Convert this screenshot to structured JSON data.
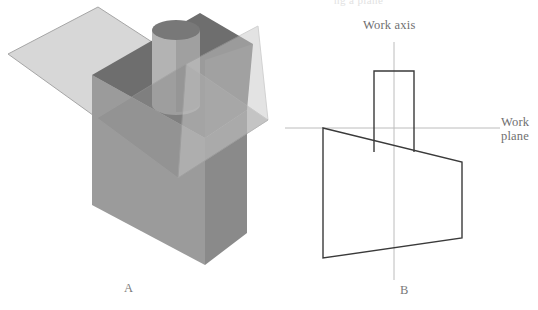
{
  "figure": {
    "background_color": "#ffffff",
    "partial_top_caption": "ng a plane",
    "panels": [
      {
        "id": "panel-a",
        "label": "A",
        "description": "Shaded 3D isometric view of a rectangular block with a cylindrical boss on top, intersected by a translucent work plane",
        "label_x": 124,
        "label_y": 282
      },
      {
        "id": "panel-b",
        "label": "B",
        "description": "2D orthographic profile outline of the same solid relative to the work axis and work plane",
        "label_x": 400,
        "label_y": 284
      }
    ],
    "annotations": [
      {
        "id": "work-axis",
        "text": "Work axis",
        "lines": [
          "Work axis"
        ],
        "x": 363,
        "y": 19
      },
      {
        "id": "work-plane",
        "text": "Work plane",
        "lines": [
          "Work",
          "plane"
        ],
        "x": 501,
        "y": 116
      }
    ],
    "colors": {
      "outline": "#3a3a3a",
      "construction_line": "#b9b9b9",
      "text": "#6f6f6f",
      "plane_translucent_light": "#d6d6d6",
      "plane_translucent_over_solid": "#8e8e8e",
      "plane_edge": "#9d9d9d",
      "block_top_face": "#6e6e6e",
      "block_front_left_face": "#9b9b9b",
      "block_front_right_face": "#8a8a8a",
      "block_side_dark_face": "#777777",
      "cylinder_top_ellipse": "#787878",
      "cylinder_body_light": "#b6b6b6",
      "cylinder_body_shadow": "#8f8f8f"
    },
    "geometry": {
      "panel_b": {
        "work_plane_line": {
          "x1": 285,
          "y1": 128,
          "x2": 500,
          "y2": 128
        },
        "work_axis_line": {
          "x1": 394,
          "y1": 42,
          "x2": 394,
          "y2": 280
        },
        "cylinder_rect": {
          "left": 374,
          "top": 71,
          "right": 414,
          "bottom": 152
        },
        "body_outline": [
          [
            323,
            128
          ],
          [
            462,
            162
          ],
          [
            462,
            238
          ],
          [
            323,
            258
          ]
        ]
      }
    }
  }
}
